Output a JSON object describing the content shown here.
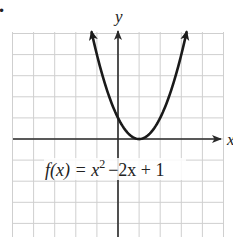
{
  "chart_data": {
    "type": "line",
    "title": "",
    "function_label": "f(x) = x² − 2x + 1",
    "function_parts": {
      "lhs": "f(x) = x",
      "exponent": "2",
      "rhs": "−2x + 1"
    },
    "xlabel": "x",
    "ylabel": "y",
    "xlim": [
      -5,
      5
    ],
    "ylim": [
      -5,
      5
    ],
    "grid": true,
    "grid_step": 1,
    "series": [
      {
        "name": "f(x) = x^2 - 2x + 1",
        "x": [
          -1.25,
          -1,
          -0.5,
          0,
          0.5,
          1,
          1.5,
          2,
          2.5,
          3,
          3.25
        ],
        "y": [
          5.06,
          4,
          2.25,
          1,
          0.25,
          0,
          0.25,
          1,
          2.25,
          4,
          5.06
        ]
      }
    ],
    "vertex": [
      1,
      0
    ],
    "y_intercept": [
      0,
      1
    ],
    "arrows_at_ends": true
  },
  "colors": {
    "grid": "#cfcfcf",
    "axis": "#2a2a2a",
    "curve": "#1a1a1a",
    "text": "#222222"
  },
  "bullet": "•"
}
